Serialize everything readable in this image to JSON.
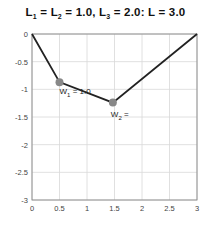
{
  "title": {
    "parts": [
      "L",
      "1",
      " = L",
      "2",
      " = 1.0, L",
      "3",
      " = 2.0: L = 3.0"
    ]
  },
  "chart_data": {
    "type": "line",
    "title": "L1 = L2 = 1.0, L3 = 2.0: L = 3.0",
    "xlabel": "",
    "ylabel": "",
    "xlim": [
      0,
      3
    ],
    "ylim": [
      -3,
      0
    ],
    "xticks": [
      "0",
      "0.5",
      "1",
      "1.5",
      "2",
      "2.5",
      "3"
    ],
    "yticks": [
      "0",
      "-0.5",
      "-1",
      "-1.5",
      "-2",
      "-2.5",
      "-3"
    ],
    "grid": true,
    "series": [
      {
        "name": "cable",
        "x": [
          0,
          0.5,
          1.47,
          3
        ],
        "y": [
          0,
          -0.87,
          -1.24,
          0
        ],
        "color": "#222222"
      }
    ],
    "markers": [
      {
        "name": "W1",
        "x": 0.5,
        "y": -0.87,
        "label": "W1 = 1.0",
        "color": "#888888"
      },
      {
        "name": "W2",
        "x": 1.47,
        "y": -1.24,
        "label": "W2 =",
        "color": "#888888"
      }
    ],
    "annotations": [
      "W1 = 1.0",
      "W2 ="
    ]
  },
  "labels": {
    "w1_main": "W",
    "w1_sub": "1",
    "w1_rest": " = 1.0",
    "w2_main": "W",
    "w2_sub": "2",
    "w2_rest": " ="
  }
}
